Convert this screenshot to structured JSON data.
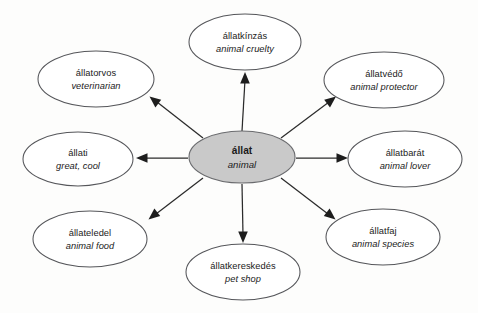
{
  "diagram": {
    "type": "mind-map",
    "title_visible": false,
    "background_color": "#fdfdfc",
    "center_fill_color": "#c9c9c9",
    "node_fill_color": "#ffffff",
    "node_stroke_color": "#55565a",
    "arrow_color": "#1d1d1d",
    "center": {
      "id": "center-allat",
      "term_hu": "állat",
      "term_en": "animal",
      "cx": 242,
      "cy": 157,
      "rx": 53,
      "ry": 26
    },
    "nodes": [
      {
        "id": "allatkinzas",
        "term_hu": "állatkínzás",
        "term_en": "animal cruelty",
        "cx": 245,
        "cy": 42,
        "rx": 56,
        "ry": 28,
        "direction": "up"
      },
      {
        "id": "allatvedo",
        "term_hu": "állatvédő",
        "term_en": "animal protector",
        "cx": 384,
        "cy": 80,
        "rx": 60,
        "ry": 28,
        "direction": "up-right"
      },
      {
        "id": "allatbarat",
        "term_hu": "állatbarát",
        "term_en": "animal lover",
        "cx": 405,
        "cy": 159,
        "rx": 57,
        "ry": 28,
        "direction": "right"
      },
      {
        "id": "allatfaj",
        "term_hu": "állatfaj",
        "term_en": "animal species",
        "cx": 383,
        "cy": 237,
        "rx": 57,
        "ry": 28,
        "direction": "down-right"
      },
      {
        "id": "allatkereskedes",
        "term_hu": "állatkereskedés",
        "term_en": "pet shop",
        "cx": 243,
        "cy": 272,
        "rx": 57,
        "ry": 28,
        "direction": "down"
      },
      {
        "id": "allateledel",
        "term_hu": "állateledel",
        "term_en": "animal food",
        "cx": 90,
        "cy": 239,
        "rx": 57,
        "ry": 28,
        "direction": "down-left"
      },
      {
        "id": "allati",
        "term_hu": "állati",
        "term_en": "great, cool",
        "cx": 78,
        "cy": 159,
        "rx": 55,
        "ry": 27,
        "direction": "left"
      },
      {
        "id": "allatorvos",
        "term_hu": "állatorvos",
        "term_en": "veterinarian",
        "cx": 96,
        "cy": 79,
        "rx": 58,
        "ry": 28,
        "direction": "up-left"
      }
    ],
    "edges": [
      {
        "from": "center-allat",
        "to": "allatkinzas",
        "x1": 242,
        "y1": 131,
        "x2": 245,
        "y2": 74
      },
      {
        "from": "center-allat",
        "to": "allatvedo",
        "x1": 281,
        "y1": 138,
        "x2": 334,
        "y2": 98
      },
      {
        "from": "center-allat",
        "to": "allatbarat",
        "x1": 296,
        "y1": 158,
        "x2": 346,
        "y2": 158
      },
      {
        "from": "center-allat",
        "to": "allatfaj",
        "x1": 281,
        "y1": 178,
        "x2": 333,
        "y2": 218
      },
      {
        "from": "center-allat",
        "to": "allatkereskedes",
        "x1": 242,
        "y1": 184,
        "x2": 243,
        "y2": 241
      },
      {
        "from": "center-allat",
        "to": "allateledel",
        "x1": 203,
        "y1": 178,
        "x2": 150,
        "y2": 218
      },
      {
        "from": "center-allat",
        "to": "allati",
        "x1": 188,
        "y1": 158,
        "x2": 138,
        "y2": 158
      },
      {
        "from": "center-allat",
        "to": "allatorvos",
        "x1": 203,
        "y1": 138,
        "x2": 151,
        "y2": 97
      }
    ]
  }
}
